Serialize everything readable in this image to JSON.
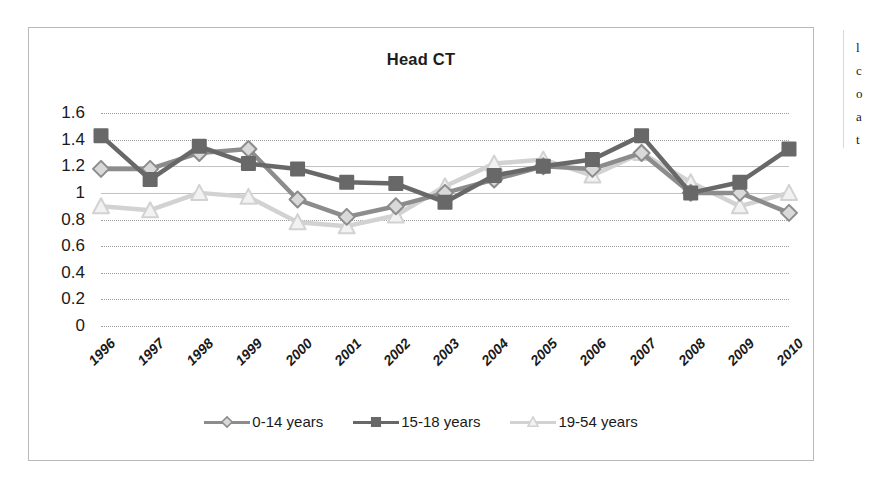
{
  "page": {
    "background": "#ffffff",
    "frame_border_color": "#b9b9b9"
  },
  "chart_data": {
    "type": "line",
    "title": "Head CT",
    "xlabel": "",
    "ylabel": "",
    "ylim": [
      0,
      1.6
    ],
    "ytick_step": 0.2,
    "grid": true,
    "legend_position": "bottom",
    "categories": [
      "1996",
      "1997",
      "1998",
      "1999",
      "2000",
      "2001",
      "2002",
      "2003",
      "2004",
      "2005",
      "2006",
      "2007",
      "2008",
      "2009",
      "2010"
    ],
    "yticks": [
      "1.6",
      "1.4",
      "1.2",
      "1",
      "0.8",
      "0.6",
      "0.4",
      "0.2",
      "0"
    ],
    "ytick_values": [
      1.6,
      1.4,
      1.2,
      1.0,
      0.8,
      0.6,
      0.4,
      0.2,
      0
    ],
    "series": [
      {
        "name": "0-14 years",
        "color": "#8c8c8c",
        "marker": "diamond",
        "values": [
          1.18,
          1.18,
          1.3,
          1.33,
          0.95,
          0.82,
          0.9,
          1.0,
          1.1,
          1.2,
          1.18,
          1.3,
          1.0,
          1.0,
          0.85
        ]
      },
      {
        "name": "15-18 years",
        "color": "#686868",
        "marker": "square",
        "values": [
          1.43,
          1.1,
          1.35,
          1.22,
          1.18,
          1.08,
          1.07,
          0.93,
          1.13,
          1.2,
          1.25,
          1.43,
          1.0,
          1.08,
          1.33
        ]
      },
      {
        "name": "19-54 years",
        "color": "#d2d2d2",
        "marker": "triangle",
        "values": [
          0.9,
          0.87,
          1.0,
          0.97,
          0.78,
          0.75,
          0.83,
          1.05,
          1.22,
          1.25,
          1.13,
          1.3,
          1.08,
          0.9,
          1.0
        ]
      }
    ]
  },
  "legend": {
    "items": [
      {
        "label": "0-14 years"
      },
      {
        "label": "15-18 years"
      },
      {
        "label": "19-54 years"
      }
    ]
  },
  "right_margin_fragments": [
    "l",
    "c",
    "o",
    "a",
    "t"
  ]
}
